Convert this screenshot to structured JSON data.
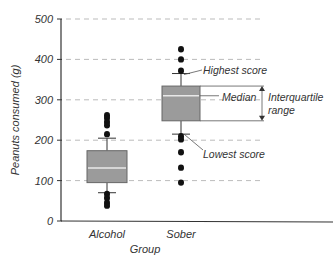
{
  "chart_data": {
    "type": "box",
    "title": "",
    "xlabel": "Group",
    "ylabel": "Peanuts consumed (g)",
    "ylim": [
      0,
      500
    ],
    "yticks": [
      0,
      100,
      200,
      300,
      400,
      500
    ],
    "grid": "horizontal dashed",
    "categories": [
      "Alcohol",
      "Sober"
    ],
    "series": [
      {
        "name": "Alcohol",
        "whisker_low": 70,
        "q1": 95,
        "median": 131,
        "q3": 174,
        "whisker_high": 205,
        "outliers": [
          262,
          255,
          245,
          237,
          215,
          67,
          57,
          45,
          38
        ]
      },
      {
        "name": "Sober",
        "whisker_low": 215,
        "q1": 248,
        "median": 310,
        "q3": 334,
        "whisker_high": 365,
        "outliers": [
          425,
          400,
          372,
          210,
          202,
          170,
          132,
          95
        ]
      }
    ],
    "annotations": [
      "Highest score",
      "Median",
      "Interquartile range",
      "Lowest score"
    ],
    "colors": {
      "box_fill": "#9b9b9b",
      "median_line": "#e8e8e8",
      "grid": "#aaaaaa",
      "points": "#111111"
    }
  },
  "axis": {
    "ylabel": "Peanuts consumed (g)",
    "xlabel": "Group",
    "ytick_labels": [
      "0",
      "100",
      "200",
      "300",
      "400",
      "500"
    ],
    "xtick_labels": [
      "Alcohol",
      "Sober"
    ]
  },
  "annotations": {
    "highest": "Highest score",
    "median": "Median",
    "iqr_line1": "Interquartile",
    "iqr_line2": "range",
    "lowest": "Lowest score"
  }
}
